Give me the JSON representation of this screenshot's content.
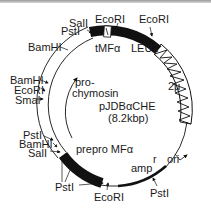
{
  "plasmid": {
    "name": "pJDBαCHE",
    "size": "(8.2kbp)"
  },
  "genes": {
    "tmf": "tMFα",
    "leu2": "LEU2",
    "two_micron": "2μ",
    "prochymosin_line1": "pro-",
    "prochymosin_line2": "chymosin",
    "prepro": "prepro MFα",
    "amp": "amp",
    "amp_sup": "r",
    "ori": "ori"
  },
  "sites": {
    "top_sall": "SalI",
    "top_pstl": "PstI",
    "top_ecori_1": "EcoRI",
    "top_ecori_2": "EcoRI",
    "left_bamhi_1": "BamHI",
    "left_bamhi_2": "BamHI",
    "left_ecori": "EcoRI",
    "left_smai": "SmaI",
    "lower_pstl": "PstI",
    "lower_bamhi": "BamHI",
    "lower_sall": "SalI",
    "bottom_pstl": "PstI",
    "bottom_ecori": "EcoRI",
    "bottom_right_pstl": "PstI"
  },
  "colors": {
    "ink": "#111111",
    "background": "#ffffff"
  }
}
